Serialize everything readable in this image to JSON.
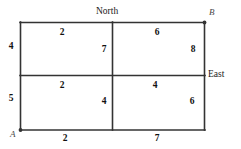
{
  "diagram": {
    "type": "grid-graph",
    "stroke_color": "#333333",
    "background_color": "#ffffff",
    "vertices": [
      {
        "id": "A",
        "label": "A",
        "position": "bottom-left",
        "marker": "dot"
      },
      {
        "id": "B",
        "label": "B",
        "position": "top-right",
        "marker": "dot"
      }
    ],
    "directions": [
      {
        "id": "north",
        "label": "North",
        "position": "top-center"
      },
      {
        "id": "east",
        "label": "East",
        "position": "right-middle"
      }
    ],
    "edge_weights": {
      "top_left_horizontal": "2",
      "top_right_horizontal": "6",
      "middle_left_horizontal": "2",
      "middle_right_horizontal": "4",
      "bottom_left_horizontal": "2",
      "bottom_right_horizontal": "7",
      "left_upper_vertical": "4",
      "left_lower_vertical": "5",
      "center_upper_vertical": "7",
      "center_lower_vertical": "4",
      "right_upper_vertical": "8",
      "right_lower_vertical": "6"
    }
  }
}
